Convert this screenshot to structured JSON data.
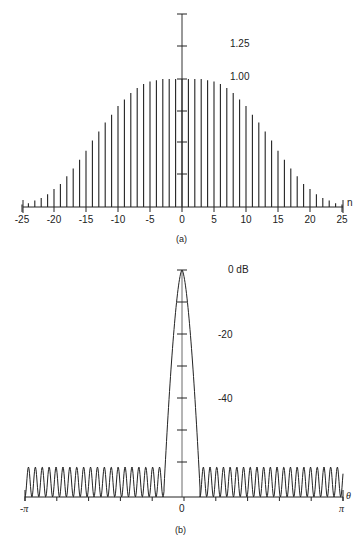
{
  "chart_data": [
    {
      "id": "a",
      "type": "bar",
      "subtype": "stem",
      "caption": "(a)",
      "xlabel": "n",
      "ylabel": "",
      "x_ticks": [
        "-25",
        "-20",
        "-15",
        "-10",
        "-5",
        "0",
        "5",
        "10",
        "15",
        "20",
        "25"
      ],
      "y_tick_labels": [
        "1.25",
        "1.00"
      ],
      "ylim": [
        0,
        1.5
      ],
      "xlim": [
        -25,
        25
      ],
      "grid": false,
      "x": [
        -25,
        -24,
        -23,
        -22,
        -21,
        -20,
        -19,
        -18,
        -17,
        -16,
        -15,
        -14,
        -13,
        -12,
        -11,
        -10,
        -9,
        -8,
        -7,
        -6,
        -5,
        -4,
        -3,
        -2,
        -1,
        0,
        1,
        2,
        3,
        4,
        5,
        6,
        7,
        8,
        9,
        10,
        11,
        12,
        13,
        14,
        15,
        16,
        17,
        18,
        19,
        20,
        21,
        22,
        23,
        24,
        25
      ],
      "values": [
        0.02,
        0.03,
        0.05,
        0.07,
        0.1,
        0.14,
        0.18,
        0.24,
        0.3,
        0.37,
        0.44,
        0.52,
        0.59,
        0.66,
        0.72,
        0.79,
        0.84,
        0.89,
        0.93,
        0.96,
        0.98,
        0.99,
        1.0,
        1.0,
        1.0,
        1.0,
        1.0,
        1.0,
        1.0,
        0.99,
        0.98,
        0.96,
        0.93,
        0.89,
        0.84,
        0.79,
        0.72,
        0.66,
        0.59,
        0.52,
        0.44,
        0.37,
        0.3,
        0.24,
        0.18,
        0.14,
        0.1,
        0.07,
        0.05,
        0.03,
        0.02
      ]
    },
    {
      "id": "b",
      "type": "line",
      "caption": "(b)",
      "xlabel": "θ",
      "ylabel": "dB",
      "x_ticks": [
        "-π",
        "0",
        "π"
      ],
      "y_tick_labels": [
        "0 dB",
        "-20",
        "-40"
      ],
      "xlim": [
        "-π",
        "π"
      ],
      "ylim": [
        -70,
        0
      ],
      "grid": false,
      "description": "Log-magnitude spectrum: narrow main lobe peaking at 0 dB at θ=0, falling steeply; sidelobes oscillate roughly between -60 dB and -70 dB across the rest of the band",
      "main_lobe_peak_db": 0,
      "sidelobe_level_db_approx": -60,
      "sidelobe_count_each_side_approx": 22
    }
  ]
}
